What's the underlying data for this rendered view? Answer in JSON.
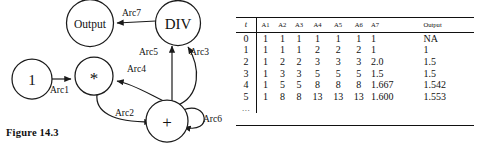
{
  "figure": {
    "caption": "Figure 14.3"
  },
  "diagram": {
    "nodes": [
      {
        "id": "one",
        "label": "1"
      },
      {
        "id": "output",
        "label": "Output"
      },
      {
        "id": "div",
        "label": "DIV"
      },
      {
        "id": "mult",
        "label": "*"
      },
      {
        "id": "plus",
        "label": "+"
      }
    ],
    "arcs": [
      {
        "id": "arc1",
        "label": "Arc1"
      },
      {
        "id": "arc2",
        "label": "Arc2"
      },
      {
        "id": "arc3",
        "label": "Arc3"
      },
      {
        "id": "arc4",
        "label": "Arc4"
      },
      {
        "id": "arc5",
        "label": "Arc5"
      },
      {
        "id": "arc6",
        "label": "Arc6"
      },
      {
        "id": "arc7",
        "label": "Arc7"
      }
    ]
  },
  "table": {
    "headers": [
      "t",
      "A1",
      "A2",
      "A3",
      "A4",
      "A5",
      "A6",
      "A7",
      "Output"
    ],
    "rows": [
      {
        "t": "0",
        "cells": [
          "1",
          "1",
          "1",
          "1",
          "1",
          "1",
          "1",
          "NA"
        ]
      },
      {
        "t": "1",
        "cells": [
          "1",
          "1",
          "1",
          "2",
          "2",
          "2",
          "1",
          "1"
        ]
      },
      {
        "t": "2",
        "cells": [
          "1",
          "2",
          "2",
          "3",
          "3",
          "3",
          "2.0",
          "1.5"
        ]
      },
      {
        "t": "3",
        "cells": [
          "1",
          "3",
          "3",
          "5",
          "5",
          "5",
          "1.5",
          "1.5"
        ]
      },
      {
        "t": "4",
        "cells": [
          "1",
          "5",
          "5",
          "8",
          "8",
          "8",
          "1.667",
          "1.542"
        ]
      },
      {
        "t": "5",
        "cells": [
          "1",
          "8",
          "8",
          "13",
          "13",
          "13",
          "1.600",
          "1.553"
        ]
      }
    ],
    "continuation": "..."
  }
}
